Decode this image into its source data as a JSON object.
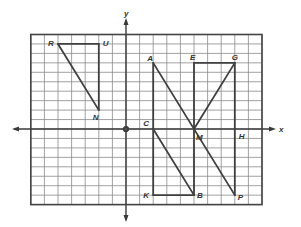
{
  "diagram": {
    "type": "coordinate-grid",
    "axes": {
      "x_label": "x",
      "y_label": "y",
      "origin_label": "O",
      "x_range": [
        -7,
        10
      ],
      "y_range": [
        -8,
        10
      ]
    },
    "colors": {
      "grid": "#8a8a8a",
      "frame": "#444444",
      "axis": "#3a3a3a",
      "figure": "#404040",
      "label": "#333333",
      "background": "#ffffff"
    },
    "points": [
      {
        "label": "R",
        "x": -5,
        "y": 9
      },
      {
        "label": "U",
        "x": -2,
        "y": 9
      },
      {
        "label": "N",
        "x": -2,
        "y": 2
      },
      {
        "label": "A",
        "x": 2,
        "y": 7
      },
      {
        "label": "E",
        "x": 5,
        "y": 7
      },
      {
        "label": "G",
        "x": 8,
        "y": 7
      },
      {
        "label": "C",
        "x": 2,
        "y": 0
      },
      {
        "label": "M",
        "x": 5,
        "y": 0
      },
      {
        "label": "H",
        "x": 8,
        "y": 0
      },
      {
        "label": "K",
        "x": 2,
        "y": -7
      },
      {
        "label": "B",
        "x": 5,
        "y": -7
      },
      {
        "label": "P",
        "x": 8,
        "y": -7
      }
    ],
    "segments": [
      [
        "R",
        "U"
      ],
      [
        "U",
        "N"
      ],
      [
        "R",
        "N"
      ],
      [
        "A",
        "K"
      ],
      [
        "K",
        "B"
      ],
      [
        "C",
        "B"
      ],
      [
        "A",
        "P"
      ],
      [
        "E",
        "G"
      ],
      [
        "E",
        "B"
      ],
      [
        "G",
        "P"
      ],
      [
        "G",
        "M"
      ]
    ],
    "figures": [
      {
        "name": "triangle-RUN",
        "vertices": [
          "R",
          "U",
          "N"
        ]
      },
      {
        "name": "triangle-CKB",
        "vertices": [
          "C",
          "K",
          "B"
        ]
      },
      {
        "name": "triangle-EGM",
        "vertices": [
          "E",
          "G",
          "M"
        ]
      },
      {
        "name": "triangle-MHP",
        "vertices": [
          "M",
          "H",
          "P"
        ]
      }
    ]
  }
}
